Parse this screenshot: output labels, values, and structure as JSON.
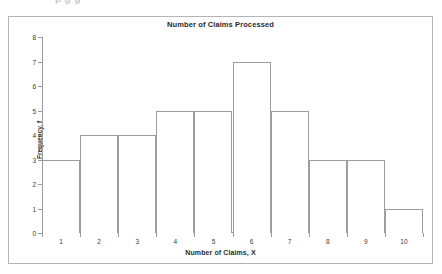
{
  "page": {
    "cutoff_text": "p        g          g"
  },
  "chart_data": {
    "type": "bar",
    "title": "Number of Claims Processed",
    "xlabel": "Number of Claims, X",
    "ylabel": "Frequency, f",
    "categories": [
      "1",
      "2",
      "3",
      "4",
      "5",
      "6",
      "7",
      "8",
      "9",
      "10"
    ],
    "values": [
      3,
      4,
      4,
      5,
      5,
      7,
      5,
      3,
      3,
      1
    ],
    "ylim": [
      0,
      8
    ],
    "yticks": [
      0,
      1,
      2,
      3,
      4,
      5,
      6,
      7,
      8
    ],
    "ytick_labels": [
      "0",
      "1",
      "2",
      "3",
      "4",
      "5",
      "6",
      "7",
      "8"
    ],
    "xtick_labels": [
      "1",
      "2",
      "3",
      "4",
      "5",
      "6",
      "7",
      "8",
      "9",
      "10"
    ],
    "grid": false,
    "legend": false,
    "bar_fill_color": "#ffffff",
    "bar_edge_color": "#9d9d9d",
    "axis_color": "#9a9a9a",
    "frame_color": "#b4b4b4",
    "background_color": "#ffffff"
  }
}
